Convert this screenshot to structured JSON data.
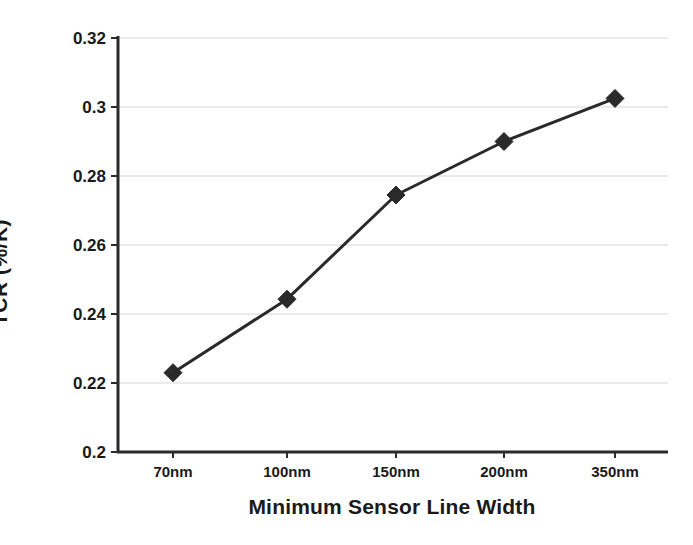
{
  "chart_data": {
    "type": "line",
    "title": "",
    "xlabel": "Minimum Sensor Line Width",
    "ylabel": "TCR (%/K)",
    "categories": [
      "70nm",
      "100nm",
      "150nm",
      "200nm",
      "350nm"
    ],
    "values": [
      0.223,
      0.2443,
      0.2745,
      0.29,
      0.3025
    ],
    "series": [
      {
        "name": "TCR",
        "values": [
          0.223,
          0.2443,
          0.2745,
          0.29,
          0.3025
        ]
      }
    ],
    "ylim": [
      0.2,
      0.32
    ],
    "ytick_labels": [
      "0.32",
      "0.3",
      "0.28",
      "0.26",
      "0.24",
      "0.22",
      "0.2"
    ],
    "ytick_values": [
      0.32,
      0.3,
      0.28,
      0.26,
      0.24,
      0.22,
      0.2
    ],
    "xtick_labels": [
      "70nm",
      "100nm",
      "150nm",
      "200nm",
      "350nm"
    ],
    "grid": true,
    "grid_axis": "y",
    "legend": false,
    "marker": "diamond",
    "line_color": "#2a2a2a",
    "marker_color": "#2a2a2a",
    "grid_color": "#d6d6d6",
    "axis_color": "#2b2b2b",
    "background": "#ffffff"
  }
}
